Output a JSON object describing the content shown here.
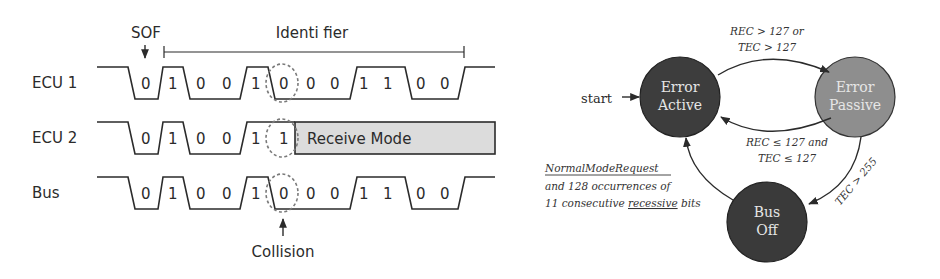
{
  "timing_diagram": {
    "sof_label": "SOF",
    "identifier_label": "Identi fier",
    "rows": [
      {
        "label": "ECU 1",
        "bits": [
          "0",
          "1",
          "0",
          "0",
          "1",
          "0",
          "0",
          "0",
          "1",
          "1",
          "0",
          "0"
        ]
      },
      {
        "label": "ECU 2",
        "bits": [
          "0",
          "1",
          "0",
          "0",
          "1",
          "1"
        ],
        "receive_mode_label": "Receive Mode"
      },
      {
        "label": "Bus",
        "bits": [
          "0",
          "1",
          "0",
          "0",
          "1",
          "0",
          "0",
          "0",
          "1",
          "1",
          "0",
          "0"
        ]
      }
    ],
    "collision_label": "Collision",
    "colors": {
      "receive_box": "#dcdcdc",
      "line": "#2b2b2b",
      "dashed_circle": "#7a7a7a"
    }
  },
  "state_diagram": {
    "start_label": "start",
    "states": [
      {
        "id": "error-active",
        "line1": "Error",
        "line2": "Active",
        "color": "#3d3d3d"
      },
      {
        "id": "error-passive",
        "line1": "Error",
        "line2": "Passive",
        "color": "#8e8e8e"
      },
      {
        "id": "bus-off",
        "line1": "Bus",
        "line2": "Off",
        "color": "#3a3a3a"
      }
    ],
    "transitions": {
      "active_to_passive": {
        "line1": "REC > 127 or",
        "line2": "TEC > 127"
      },
      "passive_to_active": {
        "line1": "REC ≤ 127 and",
        "line2": "TEC ≤ 127"
      },
      "passive_to_busoff": {
        "line1": "TEC > 255"
      },
      "busoff_to_active": {
        "line1": "NormalModeRequest",
        "line2": "and 128 occurrences of",
        "line3_prefix": "11 consecutive ",
        "line3_underlined": "recessive",
        "line3_suffix": " bits"
      }
    }
  }
}
